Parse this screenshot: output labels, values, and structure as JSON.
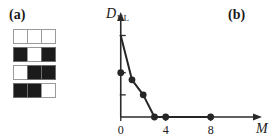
{
  "panels": {
    "a": {
      "label": "(a)"
    },
    "b": {
      "label": "(b)"
    }
  },
  "pattern_grid": {
    "rows": 4,
    "cols": 3,
    "on_color": "#1b1b1b",
    "off_color": "#ffffff",
    "border_color": "#9a9a9a",
    "cells": [
      [
        0,
        0,
        0
      ],
      [
        1,
        0,
        1
      ],
      [
        0,
        1,
        1
      ],
      [
        1,
        1,
        0
      ]
    ]
  },
  "chart_data": {
    "type": "line",
    "title": "",
    "subtitle": "",
    "xlabel": "M",
    "ylabel": "D",
    "ylabel_sub": "KL",
    "x": [
      0,
      1,
      2,
      3,
      4,
      8
    ],
    "values": [
      0.5,
      0.42,
      0.25,
      0.0,
      0.0,
      0.0
    ],
    "line_start": {
      "x": 0,
      "y": 0.92
    },
    "xlim": [
      -0.6,
      11.5
    ],
    "ylim": [
      0,
      1.05
    ],
    "xticks": [
      0,
      4,
      8
    ],
    "xtick_labels": [
      "0",
      "4",
      "8"
    ],
    "yticks": [
      0.25,
      0.5,
      0.92
    ],
    "ytick_labels": [
      "",
      "",
      ""
    ],
    "grid": false,
    "legend": false,
    "marker": "filled-circle",
    "marker_color": "#262626",
    "line_color": "#262626",
    "axis_color": "#2a2a2a",
    "axis_arrows": true
  }
}
